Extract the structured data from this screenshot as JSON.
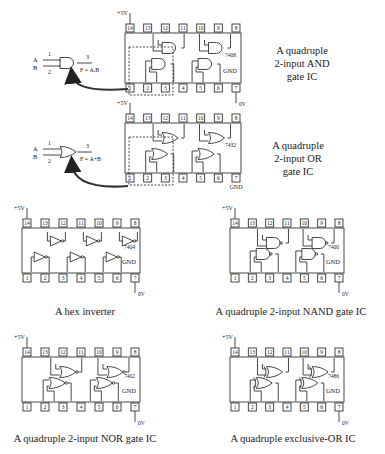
{
  "figures": [
    {
      "id": "and",
      "chip": "7408",
      "caption_lines": [
        "A quadruple",
        "2-input AND",
        "gate IC"
      ],
      "gate_formula": "F = A.B",
      "gate_type": "AND"
    },
    {
      "id": "or",
      "chip": "7432",
      "caption_lines": [
        "A quadruple",
        "2-input OR",
        "gate IC"
      ],
      "gate_formula": "F = A+B",
      "gate_type": "OR"
    },
    {
      "id": "not",
      "chip": "7404",
      "caption": "A hex inverter",
      "gate_type": "NOT"
    },
    {
      "id": "nand",
      "chip": "7400",
      "caption": "A quadruple 2-input NAND gate IC",
      "gate_type": "NAND"
    },
    {
      "id": "nor",
      "chip": "7402",
      "caption": "A quadruple 2-input NOR gate IC",
      "gate_type": "NOR"
    },
    {
      "id": "xor",
      "chip": "7486",
      "caption": "A quadruple exclusive-OR IC",
      "gate_type": "XOR"
    }
  ],
  "labels": {
    "vcc": "+5V",
    "ground_pin": "GND",
    "zero_volt": "0V",
    "input_a": "A",
    "input_b": "B",
    "pin1": "1",
    "pin2": "2",
    "pin3": "3"
  },
  "pins_top": [
    "14",
    "13",
    "12",
    "11",
    "10",
    "9",
    "8"
  ],
  "pins_bottom": [
    "1",
    "2",
    "3",
    "4",
    "5",
    "6",
    "7"
  ]
}
